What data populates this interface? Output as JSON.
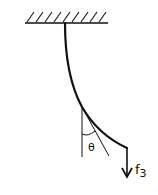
{
  "diagram": {
    "labels": {
      "angle": "θ",
      "force_main": "f",
      "force_subscript": "3"
    },
    "elements": [
      "ceiling-support (hatched)",
      "flexible-cord (curved)",
      "vertical-reference-line",
      "tangent-line",
      "angle-arc",
      "force-arrow (downward)"
    ],
    "colors": {
      "stroke": "#111111",
      "background": "#ffffff"
    }
  }
}
